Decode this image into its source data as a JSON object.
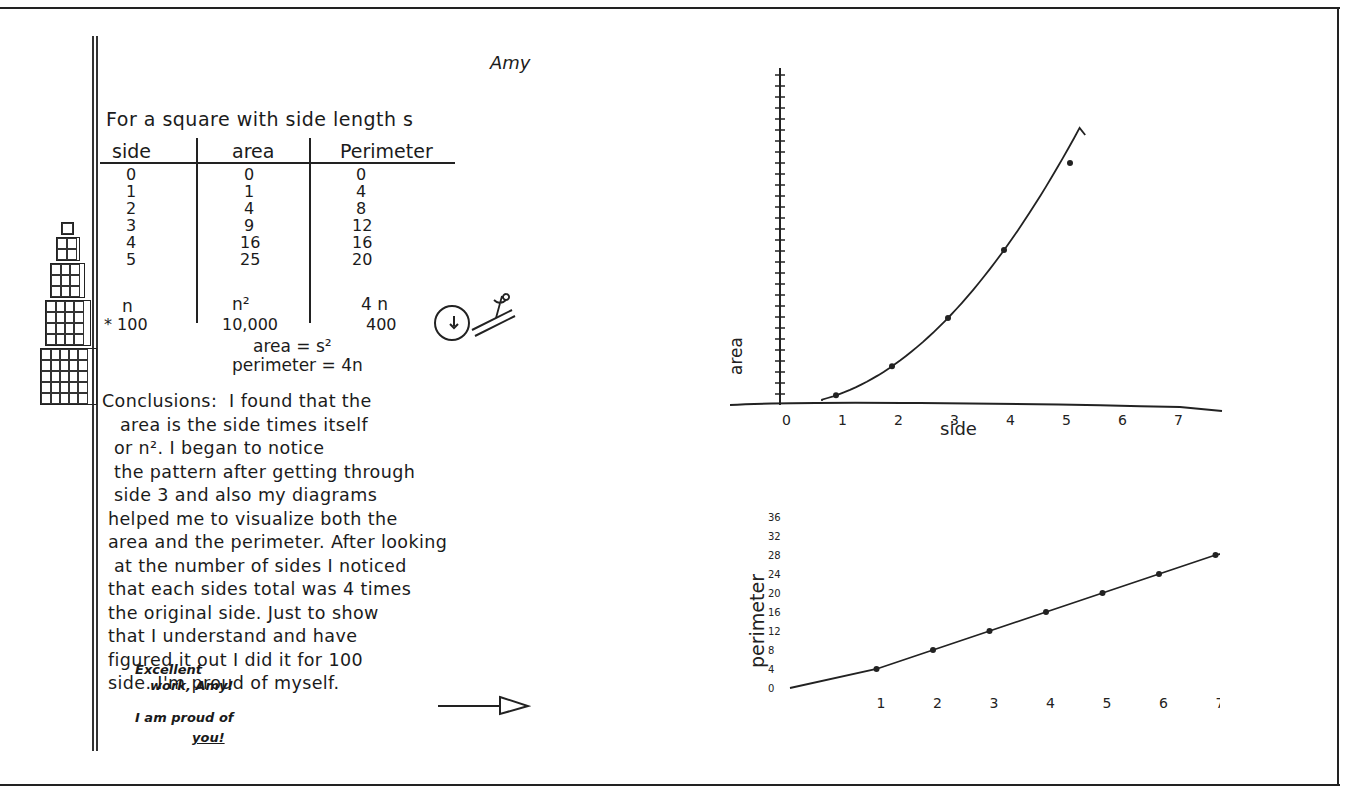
{
  "document": {
    "student_name": "Amy",
    "intro": "For a square with side length s",
    "table": {
      "headers": [
        "side",
        "area",
        "Perimeter"
      ],
      "rows": [
        [
          "0",
          "0",
          "0"
        ],
        [
          "1",
          "1",
          "4"
        ],
        [
          "2",
          "4",
          "8"
        ],
        [
          "3",
          "9",
          "12"
        ],
        [
          "4",
          "16",
          "16"
        ],
        [
          "5",
          "25",
          "20"
        ]
      ],
      "general": [
        "n",
        "n²",
        "4 n"
      ],
      "example": [
        "* 100",
        "10,000",
        "400"
      ]
    },
    "formulas": {
      "area": "area = s²",
      "perimeter": "perimeter = 4n"
    },
    "conclusions": "Conclusions:  I found that the\n   area is the side times itself\n  or n². I began to notice\n  the pattern after getting through\n  side 3 and also my diagrams\n helped me to visualize both the\n area and the perimeter. After looking\n  at the number of sides I noticed\n that each sides total was 4 times\n the original side. Just to show\n that I understand and have\n figured it out I did it for 100\n side. I'm proud of myself.",
    "teacher_comment": {
      "line1": "Excellent",
      "line2": "work, Amy!",
      "line3": "I am proud of",
      "line4": "you!"
    },
    "arrow_icon": "right-arrow-icon",
    "doodle_icon": "snail-doodle-icon",
    "square_diagrams": [
      1,
      2,
      3,
      4,
      5
    ]
  },
  "chart_data": [
    {
      "type": "line",
      "title": "",
      "xlabel": "side",
      "ylabel": "area",
      "x": [
        1,
        2,
        3,
        4,
        5
      ],
      "values": [
        1,
        4,
        9,
        16,
        25
      ],
      "x_ticks": [
        "0",
        "1",
        "2",
        "3",
        "4",
        "5",
        "6",
        "7"
      ],
      "y_ticks_unlabeled": 30,
      "xlim": [
        0,
        7.5
      ],
      "ylim": [
        0,
        30
      ],
      "grid": false
    },
    {
      "type": "line",
      "title": "",
      "xlabel": "",
      "ylabel": "perimeter",
      "x": [
        1,
        2,
        3,
        4,
        5,
        6,
        7
      ],
      "values": [
        4,
        8,
        12,
        16,
        20,
        24,
        28
      ],
      "x_ticks": [
        "1",
        "2",
        "3",
        "4",
        "5",
        "6",
        "7"
      ],
      "y_ticks": [
        "0",
        "4",
        "8",
        "12",
        "16",
        "20",
        "24",
        "28",
        "32",
        "36"
      ],
      "ylim": [
        0,
        36
      ],
      "grid": false
    }
  ]
}
